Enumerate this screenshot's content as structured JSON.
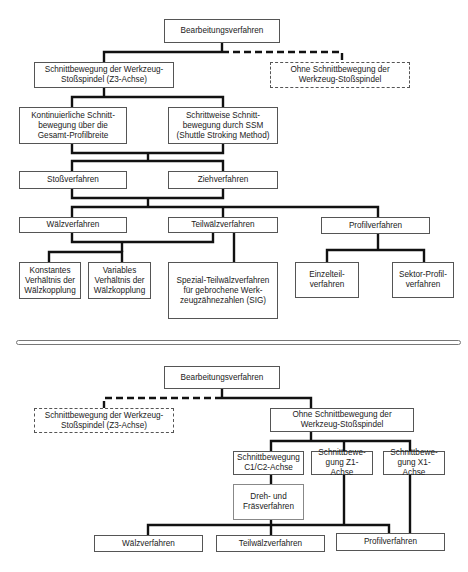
{
  "top_diagram": {
    "root": "Bearbeitungsverfahren",
    "branch_solid": "Schnittbewegung der Werkzeug-Stoßspindel (Z3-Achse)",
    "branch_dashed": "Ohne Schnittbewegung der Werkzeug-Stoßspindel",
    "continuous": "Kontinuierliche Schnitt-bewegung über die Gesamt-Profilbreite",
    "stepwise": "Schrittweise Schnitt-bewegung durch SSM (Shuttle Stroking Method)",
    "stossverfahren": "Stoßverfahren",
    "ziehverfahren": "Ziehverfahren",
    "waelzverfahren": "Wälzverfahren",
    "teilwaelzverfahren": "Teilwälzverfahren",
    "profilverfahren": "Profilverfahren",
    "konstantes": "Konstantes Verhältnis der Wälzkopplung",
    "variables": "Variables Verhältnis der Wälzkopplung",
    "sig": "Spezial-Teilwälzverfahren für gebrochene Werk-zeugzähnezahlen (SIG)",
    "einzelteil": "Einzelteil-verfahren",
    "sektor": "Sektor-Profil-verfahren"
  },
  "bottom_diagram": {
    "root": "Bearbeitungsverfahren",
    "branch_dashed": "Schnittbewegung der Werkzeug-Stoßspindel (Z3-Achse)",
    "branch_solid": "Ohne Schnittbewegung der Werkzeug-Stoßspindel",
    "c1c2": "Schnittbewegung C1/C2-Achse",
    "z1": "Schnittbewe-gung Z1-Achse",
    "x1": "Schnittbewe-gung X1-Achse",
    "dreh_fraes": "Dreh- und Fräsverfahren",
    "waelzverfahren": "Wälzverfahren",
    "teilwaelzverfahren": "Teilwälzverfahren",
    "profilverfahren": "Profilverfahren"
  }
}
